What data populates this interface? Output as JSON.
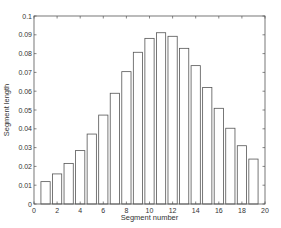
{
  "chart_data": {
    "type": "bar",
    "title": "",
    "xlabel": "Segment number",
    "ylabel": "Segment length",
    "xlim": [
      0,
      20
    ],
    "ylim": [
      0,
      0.1
    ],
    "xticks": [
      0,
      2,
      4,
      6,
      8,
      10,
      12,
      14,
      16,
      18,
      20
    ],
    "xtick_labels": [
      "0",
      "2",
      "4",
      "6",
      "8",
      "10",
      "12",
      "14",
      "16",
      "18",
      "20"
    ],
    "yticks": [
      0,
      0.01,
      0.02,
      0.03,
      0.04,
      0.05,
      0.06,
      0.07,
      0.08,
      0.09,
      0.1
    ],
    "ytick_labels": [
      "0",
      "0.01",
      "0.02",
      "0.03",
      "0.04",
      "0.05",
      "0.06",
      "0.07",
      "0.08",
      "0.09",
      "0.1"
    ],
    "grid": false,
    "categories": [
      1,
      2,
      3,
      4,
      5,
      6,
      7,
      8,
      9,
      10,
      11,
      12,
      13,
      14,
      15,
      16,
      17,
      18,
      19
    ],
    "values": [
      0.0119,
      0.016,
      0.0216,
      0.0284,
      0.0372,
      0.0473,
      0.0589,
      0.0704,
      0.0807,
      0.0881,
      0.0911,
      0.0892,
      0.0828,
      0.0736,
      0.062,
      0.0509,
      0.0403,
      0.031,
      0.0239
    ]
  }
}
